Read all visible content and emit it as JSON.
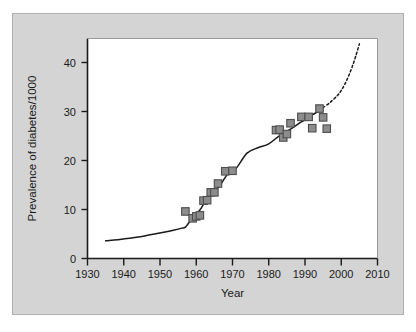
{
  "figure": {
    "background_color": "#ffffff",
    "panel_color": "#d4d4d4",
    "plot_background_color": "#ffffff",
    "axis_color": "#1a1a1a",
    "marker_fill_color": "#8c8c8c",
    "marker_edge_color": "#4d4d4d",
    "trend_line_color": "#1a1a1a",
    "projection_line_color": "#1a1a1a"
  },
  "chart_data": {
    "type": "scatter",
    "title": "",
    "xlabel": "Year",
    "ylabel": "Prevalence of diabetes/1000",
    "xlim": [
      1930,
      2010
    ],
    "ylim": [
      0,
      44
    ],
    "xticks": [
      1930,
      1940,
      1950,
      1960,
      1970,
      1980,
      1990,
      2000,
      2010
    ],
    "xtick_labels": [
      "1930",
      "1940",
      "1950",
      "1960",
      "1970",
      "1980",
      "1990",
      "2000",
      "2010"
    ],
    "yticks": [
      0,
      10,
      20,
      30,
      40
    ],
    "ytick_labels": [
      "0",
      "10",
      "20",
      "30",
      "40"
    ],
    "grid": false,
    "legend": null,
    "series": [
      {
        "name": "Observed prevalence",
        "type": "scatter",
        "marker": "square",
        "x": [
          1957,
          1959,
          1960,
          1961,
          1962,
          1963,
          1964,
          1965,
          1966,
          1968,
          1970,
          1982,
          1983,
          1984,
          1985,
          1986,
          1989,
          1991,
          1992,
          1994,
          1995,
          1996
        ],
        "y": [
          9.6,
          8.2,
          8.6,
          8.8,
          11.8,
          11.9,
          13.5,
          13.5,
          15.3,
          17.8,
          17.9,
          26.2,
          26.3,
          24.7,
          25.4,
          27.6,
          28.9,
          28.9,
          26.6,
          30.6,
          28.8,
          26.5
        ]
      },
      {
        "name": "Fitted trend",
        "type": "line",
        "style": "solid",
        "x": [
          1935,
          1940,
          1945,
          1950,
          1954,
          1956,
          1957,
          1959,
          1961,
          1963,
          1965,
          1967,
          1969,
          1971,
          1974,
          1977,
          1980,
          1983,
          1986,
          1989,
          1992,
          1994,
          1995
        ],
        "y": [
          3.6,
          4.0,
          4.5,
          5.2,
          5.8,
          6.2,
          6.4,
          8.3,
          9.9,
          12.2,
          13.6,
          15.4,
          17.6,
          18.4,
          21.5,
          22.6,
          23.4,
          25.1,
          26.4,
          27.9,
          29.3,
          30.2,
          30.8
        ]
      },
      {
        "name": "Projected trend",
        "type": "line",
        "style": "dashed",
        "x": [
          1995,
          1997,
          1999,
          2000,
          2001,
          2002,
          2003,
          2004,
          2005
        ],
        "y": [
          30.8,
          31.9,
          33.3,
          34.3,
          35.6,
          37.2,
          39.1,
          41.3,
          43.8
        ]
      }
    ]
  }
}
